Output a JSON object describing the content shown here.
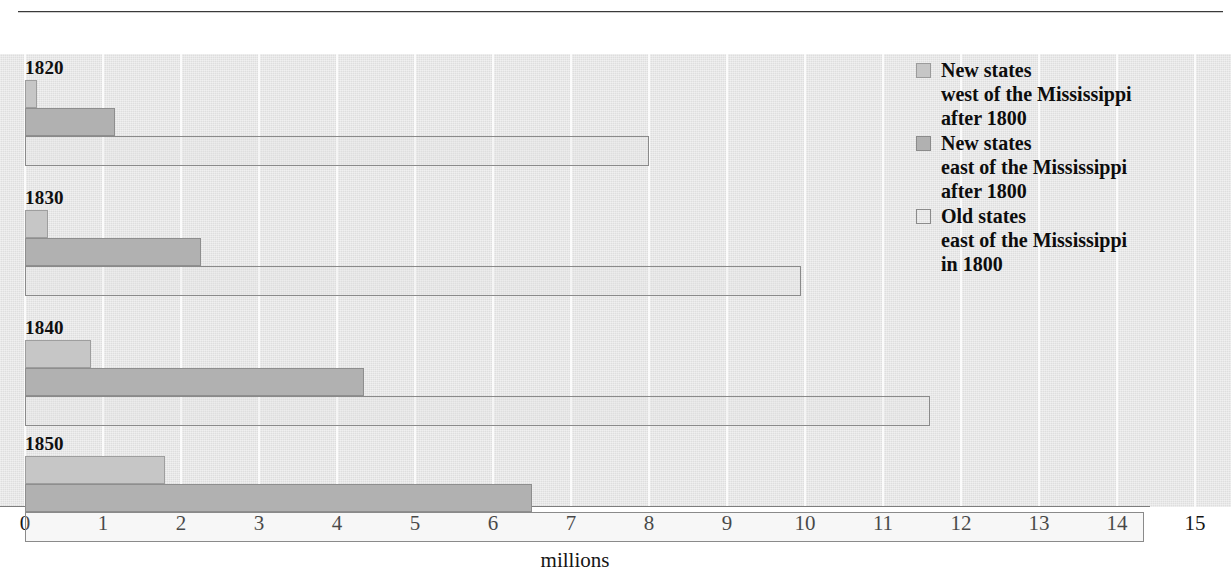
{
  "chart_data": {
    "type": "bar",
    "orientation": "horizontal",
    "title": "",
    "subtitle": "",
    "xlabel": "millions",
    "ylabel": "",
    "xlim": [
      0,
      15
    ],
    "xticks": [
      0,
      1,
      2,
      3,
      4,
      5,
      6,
      7,
      8,
      9,
      10,
      11,
      12,
      13,
      14,
      15
    ],
    "xtick_labels": [
      "0",
      "1",
      "2",
      "3",
      "4",
      "5",
      "6",
      "7",
      "8",
      "9",
      "10",
      "11",
      "12",
      "13",
      "14",
      "15"
    ],
    "grid": true,
    "grid_axis": "x",
    "legend_position": "upper-right",
    "categories": [
      "1820",
      "1830",
      "1840",
      "1850"
    ],
    "series": [
      {
        "name": "New states west of the Mississippi after 1800",
        "key": "west",
        "color": "#c6c6c6",
        "values": [
          0.15,
          0.3,
          0.85,
          1.8
        ]
      },
      {
        "name": "New states east of the Mississippi after 1800",
        "key": "east",
        "color": "#b1b1b1",
        "values": [
          1.15,
          2.25,
          4.35,
          6.5
        ]
      },
      {
        "name": "Old states east of the Mississippi in 1800",
        "key": "old",
        "color": "#dedede",
        "values": [
          8.0,
          9.95,
          11.6,
          14.35
        ]
      }
    ]
  },
  "axis": {
    "title": "millions",
    "ticks": [
      "0",
      "1",
      "2",
      "3",
      "4",
      "5",
      "6",
      "7",
      "8",
      "9",
      "10",
      "11",
      "12",
      "13",
      "14",
      "15"
    ]
  },
  "groups": [
    {
      "year": "1820",
      "west": 0.15,
      "east": 1.15,
      "old": 8.0
    },
    {
      "year": "1830",
      "west": 0.3,
      "east": 2.25,
      "old": 9.95
    },
    {
      "year": "1840",
      "west": 0.85,
      "east": 4.35,
      "old": 11.6
    },
    {
      "year": "1850",
      "west": 1.8,
      "east": 6.5,
      "old": 14.35
    }
  ],
  "legend": {
    "entries": [
      {
        "swatch": "sw-west",
        "label": "New states\nwest of the Mississippi\nafter 1800"
      },
      {
        "swatch": "sw-east",
        "label": "New states\neast of the Mississippi\nafter 1800"
      },
      {
        "swatch": "sw-old",
        "label": "Old states\neast of the Mississippi\nin 1800"
      }
    ]
  },
  "colors": {
    "plot_background": "#dedede",
    "gridline": "#fbfbfb",
    "west_bar": "#c6c6c6",
    "east_bar": "#b1b1b1",
    "old_bar_outline": "#8a8a8a",
    "text": "#151515"
  }
}
